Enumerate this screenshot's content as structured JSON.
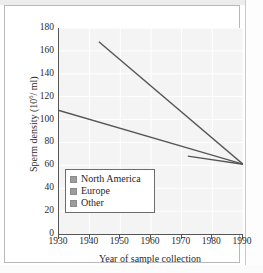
{
  "chart_data": {
    "type": "line",
    "title": "",
    "xlabel": "Year of sample collection",
    "ylabel_text": "Sperm density (10",
    "ylabel_sup": "6",
    "ylabel_tail": "/ ml)",
    "ylabel_full": "Sperm density (10^6 / ml)",
    "xlim": [
      1930,
      1990
    ],
    "ylim": [
      0,
      180
    ],
    "xticks": [
      1930,
      1940,
      1950,
      1960,
      1970,
      1980,
      1990
    ],
    "yticks": [
      0,
      20,
      40,
      60,
      80,
      100,
      120,
      140,
      160,
      180
    ],
    "grid": true,
    "legend_position": "lower-left-inside",
    "series": [
      {
        "name": "North America",
        "color": "#555555",
        "swatch": "#9c9c9c",
        "points": [
          {
            "x": 1930,
            "y": 108
          },
          {
            "x": 1990,
            "y": 61
          }
        ]
      },
      {
        "name": "Europe",
        "color": "#555555",
        "swatch": "#9c9c9c",
        "points": [
          {
            "x": 1943,
            "y": 168
          },
          {
            "x": 1990,
            "y": 61
          }
        ]
      },
      {
        "name": "Other",
        "color": "#555555",
        "swatch": "#9c9c9c",
        "points": [
          {
            "x": 1972,
            "y": 68
          },
          {
            "x": 1990,
            "y": 61
          }
        ]
      }
    ]
  }
}
